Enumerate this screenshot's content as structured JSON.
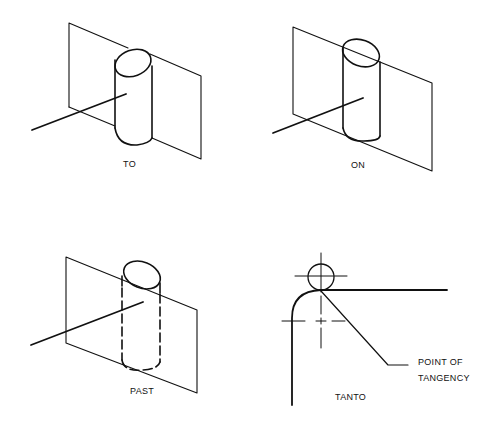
{
  "figure": {
    "panels": [
      {
        "id": "to",
        "label": "TO",
        "description": "Line extends to the plane; cylinder touches plane on its back side"
      },
      {
        "id": "on",
        "label": "ON",
        "description": "Cylinder centered on the plane; plane passes through cylinder"
      },
      {
        "id": "past",
        "label": "PAST",
        "description": "Cylinder passes through plane; hidden portion shown dashed"
      },
      {
        "id": "tanto",
        "label": "TANTO",
        "callout": [
          "POINT OF",
          "TANGENCY"
        ]
      }
    ],
    "colors": {
      "line": "#111111",
      "background": "#ffffff"
    }
  }
}
